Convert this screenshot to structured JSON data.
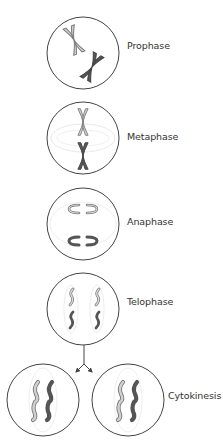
{
  "diagram": {
    "title": "",
    "colors": {
      "cell_outline": "#444444",
      "spindle": "#dddddd",
      "chromosome_light_fill": "#d0d0d0",
      "chromosome_light_stroke": "#7a7a7a",
      "chromosome_dark_fill": "#555555",
      "arrow": "#444444",
      "label_text": "#333333"
    },
    "stages": [
      {
        "id": "prophase",
        "label": "Prophase",
        "cell_center": [
          83,
          53
        ],
        "radius": 36,
        "label_pos": [
          127,
          40
        ]
      },
      {
        "id": "metaphase",
        "label": "Metaphase",
        "cell_center": [
          83,
          138
        ],
        "radius": 36,
        "label_pos": [
          127,
          131
        ]
      },
      {
        "id": "anaphase",
        "label": "Anaphase",
        "cell_center": [
          83,
          224
        ],
        "radius": 36,
        "label_pos": [
          127,
          216
        ]
      },
      {
        "id": "telophase",
        "label": "Telophase",
        "cell_center": [
          83,
          309
        ],
        "radius": 36,
        "label_pos": [
          127,
          296
        ]
      },
      {
        "id": "cytokinesis",
        "label": "Cytokinesis",
        "cell_centers": [
          [
            43,
            400
          ],
          [
            128,
            400
          ]
        ],
        "radius": 36,
        "label_pos": [
          168,
          390
        ]
      }
    ],
    "arrow": {
      "from": [
        84,
        345
      ],
      "split_at": [
        84,
        364
      ],
      "to": [
        [
          77,
          372
        ],
        [
          91,
          372
        ]
      ]
    }
  }
}
